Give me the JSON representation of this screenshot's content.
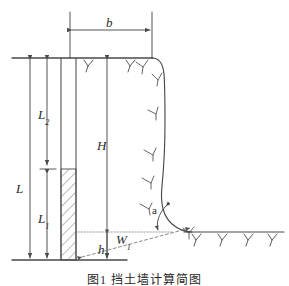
{
  "figure": {
    "domain": "engineering-cross-section",
    "caption": "图1  挡土墙计算简图",
    "background_color": "#ffffff",
    "line_color": "#4a4a4a",
    "label_color": "#2b2b2b",
    "width": 289,
    "height": 286
  },
  "labels": {
    "b": {
      "text": "b",
      "sub": "",
      "description": "wall top width dimension"
    },
    "L": {
      "text": "L",
      "sub": "",
      "description": "total left vertical dimension"
    },
    "L2": {
      "text": "L",
      "sub": "2",
      "description": "upper segment length"
    },
    "L1": {
      "text": "L",
      "sub": "1",
      "description": "lower segment length"
    },
    "H": {
      "text": "H",
      "sub": "",
      "description": "wall height"
    },
    "h": {
      "text": "h",
      "sub": "",
      "description": "toe height above base"
    },
    "W1": {
      "text": "W",
      "sub": "1",
      "description": "horizontal width to slope toe"
    },
    "a": {
      "text": "a",
      "sub": "",
      "description": "slope inclination angle"
    }
  },
  "geometry": {
    "top_ground_line": {
      "x1": 12,
      "y1": 58,
      "x2": 152,
      "y2": 58
    },
    "bottom_base_line": {
      "x1": 12,
      "y1": 260,
      "x2": 126,
      "y2": 260
    },
    "right_ground_line": {
      "x1": 186,
      "y1": 232,
      "x2": 283,
      "y2": 232
    },
    "wall_left_edge": {
      "x": 61,
      "y1": 58,
      "y2": 260
    },
    "wall_right_edge": {
      "x": 76,
      "y1": 58,
      "y2": 260
    },
    "hatched_block": {
      "x": 61,
      "y": 169,
      "w": 15,
      "h": 91
    },
    "dim_L": {
      "x": 30,
      "y1": 58,
      "y2": 260
    },
    "dim_L2": {
      "x": 47,
      "y1": 58,
      "y2": 166
    },
    "dim_L1": {
      "x": 47,
      "y1": 172,
      "y2": 260
    },
    "dim_H": {
      "x": 107,
      "y1": 58,
      "y2": 260
    },
    "dim_h": {
      "x": 107,
      "y1": 232,
      "y2": 260
    },
    "dim_b": {
      "x1": 70,
      "x2": 152,
      "y": 30
    },
    "dotted_level_line": {
      "x1": 78,
      "y1": 232,
      "x2": 170,
      "y2": 232
    },
    "dashed_slope_line": {
      "x1": 80,
      "y1": 258,
      "x2": 192,
      "y2": 228
    },
    "angle_arc": {
      "cx": 163,
      "cy": 231,
      "r": 26,
      "label": "a"
    }
  },
  "annotations": {
    "curve_note": "smooth S-curve from wall top to toe, with slope hatch ticks",
    "ground_hatch_count_top": 2,
    "ground_hatch_count_right": 4,
    "curve_hatch_count": 6
  }
}
